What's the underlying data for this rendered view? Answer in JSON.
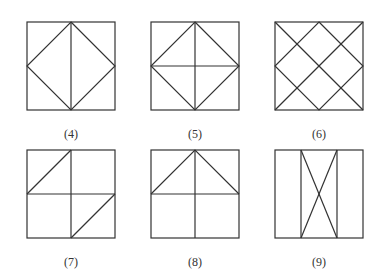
{
  "figures": [
    {
      "label": "(4)",
      "x": 27,
      "y": 22,
      "size": 88,
      "label_x": 41,
      "label_y": 127,
      "description": "square with vertical midline and inscribed diamond through edge midpoints"
    },
    {
      "label": "(5)",
      "x": 151,
      "y": 22,
      "size": 88,
      "label_x": 165,
      "label_y": 127,
      "description": "square with vertical and horizontal midlines and inscribed diamond"
    },
    {
      "label": "(6)",
      "x": 275,
      "y": 22,
      "size": 88,
      "label_x": 289,
      "label_y": 127,
      "description": "square with both diagonals and inscribed diamond"
    },
    {
      "label": "(7)",
      "x": 27,
      "y": 150,
      "size": 88,
      "label_x": 41,
      "label_y": 255,
      "description": "square with midlines, diagonal in top-left and bottom-right quadrants"
    },
    {
      "label": "(8)",
      "x": 151,
      "y": 150,
      "size": 88,
      "label_x": 165,
      "label_y": 255,
      "description": "square with midlines and triangle roof in top half"
    },
    {
      "label": "(9)",
      "x": 275,
      "y": 150,
      "size": 88,
      "label_x": 289,
      "label_y": 255,
      "description": "square with two vertical lines forming central strip with X inside"
    }
  ],
  "style": {
    "stroke": "#333333",
    "stroke_width": 1.2
  }
}
